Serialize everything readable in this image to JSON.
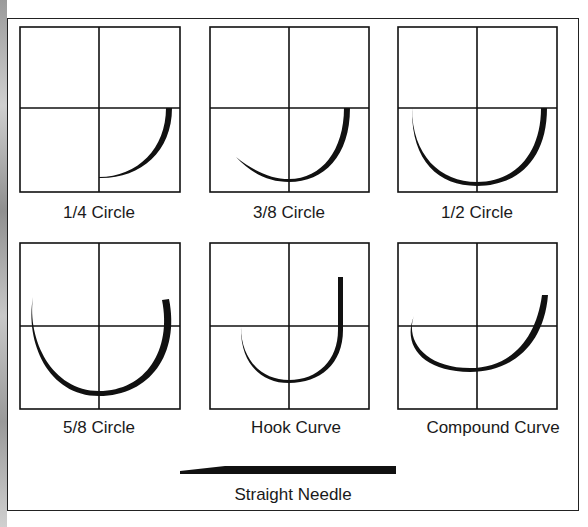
{
  "figure": {
    "panels": [
      {
        "id": "quarter",
        "label": "1/4 Circle"
      },
      {
        "id": "three-eighths",
        "label": "3/8 Circle"
      },
      {
        "id": "half",
        "label": "1/2 Circle"
      },
      {
        "id": "five-eighths",
        "label": "5/8 Circle"
      },
      {
        "id": "hook",
        "label": "Hook Curve"
      },
      {
        "id": "compound",
        "label": "Compound Curve"
      }
    ],
    "straight": {
      "label": "Straight Needle"
    },
    "colors": {
      "ink": "#111111",
      "background": "#ffffff",
      "binding": "#a0a0a0"
    }
  }
}
